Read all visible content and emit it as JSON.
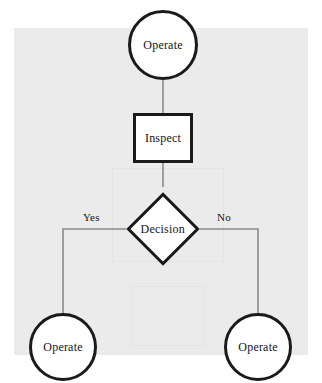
{
  "diagram": {
    "type": "flowchart",
    "title": "",
    "background_color": "#ebebeb",
    "node_border_color": "#1a1a1a",
    "node_fill_color": "#ffffff",
    "edge_color": "#8a8a8a",
    "nodes": [
      {
        "id": "operate_top",
        "label": "Operate",
        "shape": "circle"
      },
      {
        "id": "inspect",
        "label": "Inspect",
        "shape": "rectangle"
      },
      {
        "id": "decision",
        "label": "Decision",
        "shape": "diamond"
      },
      {
        "id": "operate_left",
        "label": "Operate",
        "shape": "circle"
      },
      {
        "id": "operate_right",
        "label": "Operate",
        "shape": "circle"
      }
    ],
    "edges": [
      {
        "from": "operate_top",
        "to": "inspect",
        "label": ""
      },
      {
        "from": "inspect",
        "to": "decision",
        "label": ""
      },
      {
        "from": "decision",
        "to": "operate_left",
        "label": "Yes"
      },
      {
        "from": "decision",
        "to": "operate_right",
        "label": "No"
      }
    ],
    "edge_labels": {
      "yes": "Yes",
      "no": "No"
    }
  }
}
